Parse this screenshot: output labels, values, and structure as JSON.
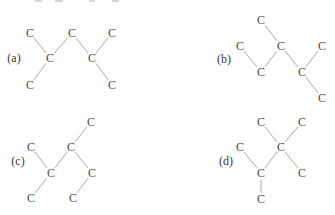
{
  "page": {
    "width": 335,
    "height": 215,
    "background": "#ffffff"
  },
  "colors": {
    "atom_text": "#4a4a4a",
    "label_text": "#383838",
    "bond_line": "#aaaaaa",
    "top_artifact": "#d8d8d8"
  },
  "molecules": [
    {
      "id": "a",
      "label": "(a)",
      "label_x": 14,
      "label_y": 58,
      "atoms": [
        {
          "symbol": "C",
          "x": 30,
          "y": 33
        },
        {
          "symbol": "C",
          "x": 72,
          "y": 33
        },
        {
          "symbol": "C",
          "x": 112,
          "y": 33
        },
        {
          "symbol": "C",
          "x": 50,
          "y": 58
        },
        {
          "symbol": "C",
          "x": 92,
          "y": 58
        },
        {
          "symbol": "C",
          "x": 30,
          "y": 85
        },
        {
          "symbol": "C",
          "x": 112,
          "y": 85
        }
      ],
      "bonds": [
        [
          0,
          3
        ],
        [
          1,
          3
        ],
        [
          1,
          4
        ],
        [
          2,
          4
        ],
        [
          3,
          5
        ],
        [
          4,
          6
        ]
      ]
    },
    {
      "id": "b",
      "label": "(b)",
      "label_x": 224,
      "label_y": 59,
      "atoms": [
        {
          "symbol": "C",
          "x": 261,
          "y": 20
        },
        {
          "symbol": "C",
          "x": 240,
          "y": 46
        },
        {
          "symbol": "C",
          "x": 281,
          "y": 46
        },
        {
          "symbol": "C",
          "x": 322,
          "y": 46
        },
        {
          "symbol": "C",
          "x": 261,
          "y": 72
        },
        {
          "symbol": "C",
          "x": 302,
          "y": 72
        },
        {
          "symbol": "C",
          "x": 322,
          "y": 98
        }
      ],
      "bonds": [
        [
          0,
          2
        ],
        [
          1,
          4
        ],
        [
          4,
          2
        ],
        [
          2,
          5
        ],
        [
          5,
          3
        ],
        [
          5,
          6
        ]
      ]
    },
    {
      "id": "c",
      "label": "(c)",
      "label_x": 18,
      "label_y": 161,
      "atoms": [
        {
          "symbol": "C",
          "x": 91,
          "y": 122
        },
        {
          "symbol": "C",
          "x": 31,
          "y": 147
        },
        {
          "symbol": "C",
          "x": 71,
          "y": 147
        },
        {
          "symbol": "C",
          "x": 51,
          "y": 173
        },
        {
          "symbol": "C",
          "x": 92,
          "y": 173
        },
        {
          "symbol": "C",
          "x": 31,
          "y": 198
        },
        {
          "symbol": "C",
          "x": 73,
          "y": 198
        }
      ],
      "bonds": [
        [
          0,
          2
        ],
        [
          1,
          3
        ],
        [
          3,
          2
        ],
        [
          2,
          4
        ],
        [
          3,
          5
        ],
        [
          4,
          6
        ]
      ]
    },
    {
      "id": "d",
      "label": "(d)",
      "label_x": 226,
      "label_y": 161,
      "atoms": [
        {
          "symbol": "C",
          "x": 261,
          "y": 122
        },
        {
          "symbol": "C",
          "x": 302,
          "y": 122
        },
        {
          "symbol": "C",
          "x": 240,
          "y": 147
        },
        {
          "symbol": "C",
          "x": 281,
          "y": 147
        },
        {
          "symbol": "C",
          "x": 261,
          "y": 173
        },
        {
          "symbol": "C",
          "x": 302,
          "y": 173
        },
        {
          "symbol": "C",
          "x": 261,
          "y": 199
        }
      ],
      "bonds": [
        [
          0,
          3
        ],
        [
          1,
          3
        ],
        [
          2,
          4
        ],
        [
          4,
          3
        ],
        [
          3,
          5
        ],
        [
          4,
          6
        ]
      ]
    }
  ],
  "top_edge_artifacts": [
    {
      "x": 35,
      "y": 0,
      "w": 7,
      "h": 2
    },
    {
      "x": 55,
      "y": 0,
      "w": 8,
      "h": 2
    },
    {
      "x": 89,
      "y": 0,
      "w": 6,
      "h": 2
    },
    {
      "x": 112,
      "y": 0,
      "w": 7,
      "h": 2
    }
  ],
  "render": {
    "bond_gap": 6.5,
    "bond_width": 1
  }
}
